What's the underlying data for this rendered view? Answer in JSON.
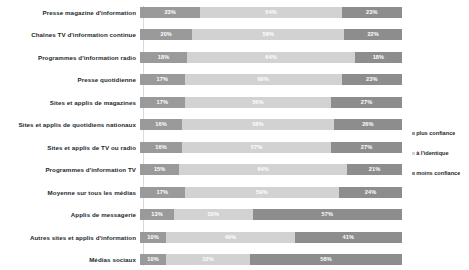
{
  "chart_data": {
    "type": "bar",
    "subtype": "stacked-horizontal-100",
    "title": "",
    "xlabel": "",
    "ylabel": "",
    "xlim": [
      0,
      100
    ],
    "grid": false,
    "legend_position": "right",
    "value_suffix": "%",
    "categories": [
      "Presse magazine d'information",
      "Chaînes TV d'information continue",
      "Programmes d'information radio",
      "Presse quotidienne",
      "Sites et applis de magazines",
      "Sites et applis de quotidiens nationaux",
      "Sites et applis de TV ou radio",
      "Programmes d'information TV",
      "Moyenne sur tous les médias",
      "Applis de messagerie",
      "Autres sites et applis d'information",
      "Médias sociaux"
    ],
    "series": [
      {
        "name": "plus confiance",
        "color": "#9a9a9a",
        "values": [
          23,
          20,
          18,
          17,
          17,
          16,
          16,
          15,
          17,
          13,
          10,
          10
        ]
      },
      {
        "name": "à l'identique",
        "color": "#d2d2d2",
        "values": [
          54,
          58,
          64,
          60,
          56,
          58,
          57,
          64,
          59,
          30,
          49,
          32
        ]
      },
      {
        "name": "moins confiance",
        "color": "#8d8d8d",
        "values": [
          23,
          22,
          18,
          23,
          27,
          26,
          27,
          21,
          24,
          57,
          41,
          58
        ]
      }
    ],
    "legend": [
      "plus confiance",
      "à l'identique",
      "moins confiance"
    ],
    "rows": [
      {
        "label": "Presse magazine d'information",
        "a": "23%",
        "b": "54%",
        "c": "23%",
        "av": 23,
        "bv": 54,
        "cv": 23
      },
      {
        "label": "Chaînes TV d'information continue",
        "a": "20%",
        "b": "58%",
        "c": "22%",
        "av": 20,
        "bv": 58,
        "cv": 22
      },
      {
        "label": "Programmes d'information radio",
        "a": "18%",
        "b": "64%",
        "c": "18%",
        "av": 18,
        "bv": 64,
        "cv": 18
      },
      {
        "label": "Presse quotidienne",
        "a": "17%",
        "b": "60%",
        "c": "23%",
        "av": 17,
        "bv": 60,
        "cv": 23
      },
      {
        "label": "Sites et applis de magazines",
        "a": "17%",
        "b": "56%",
        "c": "27%",
        "av": 17,
        "bv": 56,
        "cv": 27
      },
      {
        "label": "Sites et applis de quotidiens nationaux",
        "a": "16%",
        "b": "58%",
        "c": "26%",
        "av": 16,
        "bv": 58,
        "cv": 26
      },
      {
        "label": "Sites et applis de TV ou radio",
        "a": "16%",
        "b": "57%",
        "c": "27%",
        "av": 16,
        "bv": 57,
        "cv": 27
      },
      {
        "label": "Programmes d'information TV",
        "a": "15%",
        "b": "64%",
        "c": "21%",
        "av": 15,
        "bv": 64,
        "cv": 21
      },
      {
        "label": "Moyenne sur tous les médias",
        "a": "17%",
        "b": "59%",
        "c": "24%",
        "av": 17,
        "bv": 59,
        "cv": 24
      },
      {
        "label": "Applis de messagerie",
        "a": "13%",
        "b": "30%",
        "c": "57%",
        "av": 13,
        "bv": 30,
        "cv": 57
      },
      {
        "label": "Autres sites et applis d'information",
        "a": "10%",
        "b": "49%",
        "c": "41%",
        "av": 10,
        "bv": 49,
        "cv": 41
      },
      {
        "label": "Médias sociaux",
        "a": "10%",
        "b": "32%",
        "c": "58%",
        "av": 10,
        "bv": 32,
        "cv": 58
      }
    ]
  }
}
